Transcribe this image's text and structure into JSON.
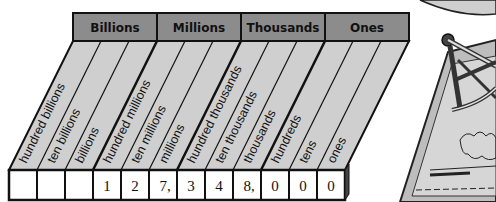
{
  "diagram": {
    "groups": [
      {
        "label": "Billions"
      },
      {
        "label": "Millions"
      },
      {
        "label": "Thousands"
      },
      {
        "label": "Ones"
      }
    ],
    "places": [
      {
        "label": "hundred billions",
        "digit": ""
      },
      {
        "label": "ten billions",
        "digit": ""
      },
      {
        "label": "billions",
        "digit": ""
      },
      {
        "label": "hundred millions",
        "digit": "1"
      },
      {
        "label": "ten millions",
        "digit": "2"
      },
      {
        "label": "millions",
        "digit": "7,"
      },
      {
        "label": "hundred thousands",
        "digit": "3"
      },
      {
        "label": "ten thousands",
        "digit": "4"
      },
      {
        "label": "thousands",
        "digit": "8,"
      },
      {
        "label": "hundreds",
        "digit": "0"
      },
      {
        "label": "tens",
        "digit": "0"
      },
      {
        "label": "ones",
        "digit": "0"
      }
    ],
    "number": "127,348,000",
    "illustration": "sextant-on-map",
    "colors": {
      "header_fill": "#8c8c8c",
      "column_fill": "#cfcfcf",
      "cell_fill": "#ffffff",
      "stroke": "#111111"
    }
  }
}
